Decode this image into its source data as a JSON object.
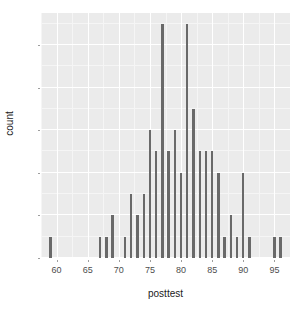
{
  "chart_data": {
    "type": "bar",
    "title": "",
    "subtitle": "",
    "xlabel": "posttest",
    "ylabel": "count",
    "xlim": [
      57.5,
      97.5
    ],
    "ylim": [
      0,
      11.5
    ],
    "grid": true,
    "legend": "none",
    "xticks": [
      60,
      65,
      70,
      75,
      80,
      85,
      90,
      95
    ],
    "yticks": [
      0,
      2,
      4,
      6,
      8,
      10
    ],
    "xtick_labels": [
      "60",
      "65",
      "70",
      "75",
      "80",
      "85",
      "90",
      "95"
    ],
    "ytick_labels": [
      "0",
      "2",
      "4",
      "6",
      "8",
      "10"
    ],
    "bar_width_units": 0.38,
    "bar_color": "#696969",
    "panel_color": "#ebebeb",
    "gridline_color": "#ffffff",
    "x": [
      59,
      67,
      68,
      69,
      71,
      72,
      73,
      74,
      75,
      76,
      77,
      78,
      79,
      80,
      81,
      82,
      83,
      84,
      85,
      86,
      87,
      88,
      89,
      90,
      91,
      95,
      96
    ],
    "values": [
      1,
      1,
      1,
      2,
      1,
      3,
      2,
      3,
      6,
      5,
      11,
      5,
      6,
      4,
      11,
      7,
      5,
      5,
      5,
      4,
      1,
      2,
      1,
      4,
      1,
      1,
      1
    ],
    "categories": [
      "59",
      "67",
      "68",
      "69",
      "71",
      "72",
      "73",
      "74",
      "75",
      "76",
      "77",
      "78",
      "79",
      "80",
      "81",
      "82",
      "83",
      "84",
      "85",
      "86",
      "87",
      "88",
      "89",
      "90",
      "91",
      "95",
      "96"
    ]
  },
  "axes": {
    "x_title": "posttest",
    "y_title": "count"
  }
}
